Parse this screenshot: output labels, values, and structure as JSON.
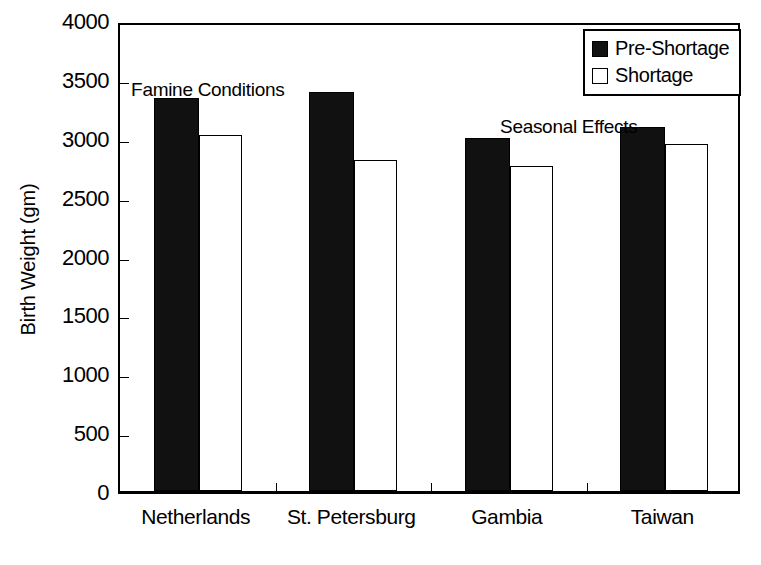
{
  "chart_data": {
    "type": "bar",
    "title": "",
    "xlabel": "",
    "ylabel": "Birth Weight (gm)",
    "ylim": [
      0,
      4000
    ],
    "yticks": [
      0,
      500,
      1000,
      1500,
      2000,
      2500,
      3000,
      3500,
      4000
    ],
    "ytick_labels": [
      "0",
      "500",
      "1000",
      "1500",
      "2000",
      "2500",
      "3000",
      "3500",
      "4000"
    ],
    "grid": false,
    "legend_position": "top-right",
    "categories": [
      "Netherlands",
      "St. Petersburg",
      "Gambia",
      "Taiwan"
    ],
    "series": [
      {
        "name": "Pre-Shortage",
        "color": "#111111",
        "fill": "solid",
        "values": [
          3340,
          3390,
          3000,
          3090
        ]
      },
      {
        "name": "Shortage",
        "color": "#ffffff",
        "fill": "hollow",
        "values": [
          3020,
          2810,
          2760,
          2945
        ]
      }
    ],
    "annotations": [
      {
        "text": "Famine Conditions",
        "near_categories": [
          "Netherlands",
          "St. Petersburg"
        ]
      },
      {
        "text": "Seasonal Effects",
        "near_categories": [
          "Gambia",
          "Taiwan"
        ]
      }
    ]
  },
  "legend": {
    "entries": [
      {
        "label": "Pre-Shortage",
        "swatch": "filled-square-icon"
      },
      {
        "label": "Shortage",
        "swatch": "hollow-square-icon"
      }
    ]
  },
  "axes": {
    "y_title": "Birth Weight (gm)",
    "y_tick_labels": [
      "4000",
      "3500",
      "3000",
      "2500",
      "2000",
      "1500",
      "1000",
      "500",
      "0"
    ],
    "x_tick_labels": [
      "Netherlands",
      "St. Petersburg",
      "Gambia",
      "Taiwan"
    ]
  },
  "annotations": {
    "famine": "Famine Conditions",
    "seasonal": "Seasonal Effects"
  }
}
